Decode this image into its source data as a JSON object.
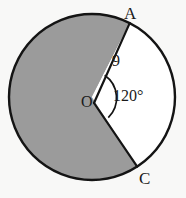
{
  "figure": {
    "type": "circle-sector-diagram",
    "background_color": "#f8f8f7",
    "stroke_color": "#141414",
    "shaded_fill": "#9b9b9b",
    "unshaded_fill": "#ffffff",
    "circle": {
      "center_x": 92,
      "center_y": 97,
      "radius_px": 83,
      "radius_label": "9"
    },
    "center_label": "O",
    "points": [
      {
        "name": "A",
        "label": "A",
        "x": 130,
        "y": 23,
        "angle_deg": -63
      },
      {
        "name": "C",
        "label": "C",
        "x": 138,
        "y": 166,
        "angle_deg": 57
      }
    ],
    "angle": {
      "label": "120°",
      "value": 120,
      "unit": "degrees",
      "vertex": "O",
      "between": [
        "A",
        "C"
      ]
    },
    "regions": [
      {
        "name": "shaded-major-sector",
        "sweep_deg": 240,
        "fill": "#9b9b9b"
      },
      {
        "name": "unshaded-minor-sector",
        "sweep_deg": 120,
        "fill": "#ffffff"
      }
    ]
  }
}
